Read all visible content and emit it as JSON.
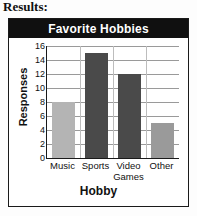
{
  "page": {
    "heading": "Results:"
  },
  "chart": {
    "title": "Favorite Hobbies",
    "title_bar_color": "#101010",
    "title_text_color": "#ffffff",
    "border_color": "#1a1a1a",
    "gridline_color": "#9a9a9a"
  },
  "chart_data": {
    "type": "bar",
    "title": "Favorite Hobbies",
    "xlabel": "Hobby",
    "ylabel": "Responses",
    "categories": [
      "Music",
      "Sports",
      "Video Games",
      "Other"
    ],
    "category_lines": [
      [
        "Music"
      ],
      [
        "Sports"
      ],
      [
        "Video",
        "Games"
      ],
      [
        "Other"
      ]
    ],
    "values": [
      8,
      15,
      12,
      5
    ],
    "bar_colors": [
      "#b4b4b4",
      "#4a4a4a",
      "#4a4a4a",
      "#9a9a9a"
    ],
    "ylim": [
      0,
      16
    ],
    "ytick_labels": [
      "0",
      "2",
      "4",
      "6",
      "8",
      "10",
      "12",
      "14",
      "16"
    ],
    "ytick_values": [
      0,
      2,
      4,
      6,
      8,
      10,
      12,
      14,
      16
    ],
    "grid": true,
    "legend": false
  }
}
